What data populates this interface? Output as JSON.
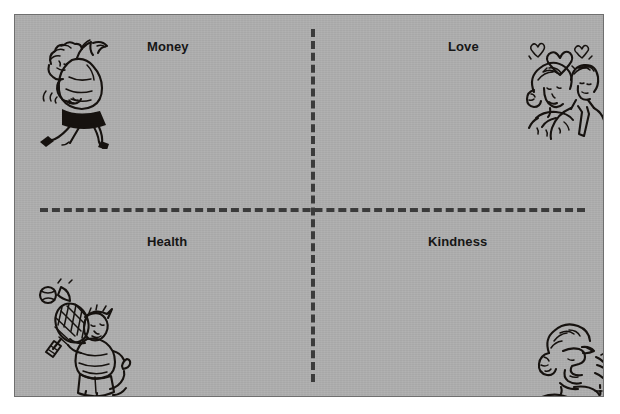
{
  "diagram": {
    "type": "quadrant",
    "background_color": "#aeaeae",
    "border_color": "#6f6f6f",
    "divider_color": "#3b3b3b",
    "divider_style": "dashed",
    "label_color": "#161616",
    "quadrants": [
      {
        "position": "top-left",
        "label": "Money",
        "illustration": "running-person-with-money-bag-icon"
      },
      {
        "position": "top-right",
        "label": "Love",
        "illustration": "couple-embracing-with-hearts-icon"
      },
      {
        "position": "bottom-left",
        "label": "Health",
        "illustration": "tennis-player-icon"
      },
      {
        "position": "bottom-right",
        "label": "Kindness",
        "illustration": "elderly-woman-portrait-icon"
      }
    ]
  }
}
